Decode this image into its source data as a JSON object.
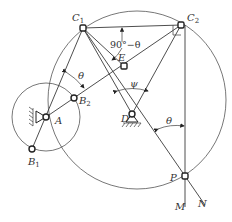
{
  "diagram": {
    "type": "linkage-geometry",
    "colors": {
      "line": "#3a3a3a",
      "background": "#ffffff"
    },
    "points": {
      "C1": {
        "label": "C",
        "sub": "1"
      },
      "C2": {
        "label": "C",
        "sub": "2"
      },
      "E": {
        "label": "E",
        "sub": ""
      },
      "B2": {
        "label": "B",
        "sub": "2"
      },
      "A": {
        "label": "A",
        "sub": ""
      },
      "B1": {
        "label": "B",
        "sub": "1"
      },
      "D": {
        "label": "D",
        "sub": ""
      },
      "P": {
        "label": "P",
        "sub": ""
      },
      "M": {
        "label": "M",
        "sub": ""
      },
      "N": {
        "label": "N",
        "sub": ""
      }
    },
    "angles": {
      "complement": "90°−θ",
      "theta_at_A": "θ",
      "psi": "ψ",
      "theta_at_P": "θ"
    },
    "circles": [
      "crank circle centered at A through B1, B2",
      "circle through C1, C2, A, P"
    ],
    "annotations": [
      "right-angle mark at C2",
      "fixed pivot at A",
      "fixed pivot at D"
    ]
  }
}
